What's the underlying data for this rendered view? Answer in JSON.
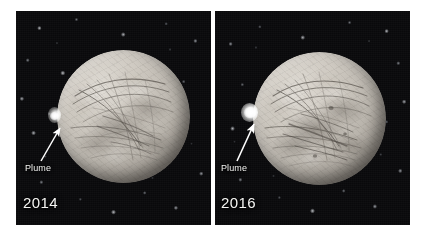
{
  "figure": {
    "name": "europa-plume-comparison",
    "background_color": "#ffffff",
    "panel_count": 2
  },
  "panels": [
    {
      "id": "panel-2014",
      "year_label": "2014",
      "plume_label": "Plume",
      "subject": "Europa",
      "background": "starfield",
      "moon_color": "#cfcac2",
      "plume_color": "#ffffff",
      "annotation_arrow": "arrow-up-right",
      "plume_position": "west-limb",
      "plume_relative_size": "small"
    },
    {
      "id": "panel-2016",
      "year_label": "2016",
      "plume_label": "Plume",
      "subject": "Europa",
      "background": "starfield",
      "moon_color": "#cfcac2",
      "plume_color": "#ffffff",
      "annotation_arrow": "arrow-up-right",
      "plume_position": "west-limb",
      "plume_relative_size": "large"
    }
  ],
  "colors": {
    "page_background": "#ffffff",
    "space_background": "#09090b",
    "moon_highlight": "#dedad3",
    "moon_midtone": "#b8b3ab",
    "moon_shadow": "#4a4641",
    "label_text": "#f5f5f3",
    "plume_highlight": "#ffffff",
    "lineae": "#57524c"
  }
}
